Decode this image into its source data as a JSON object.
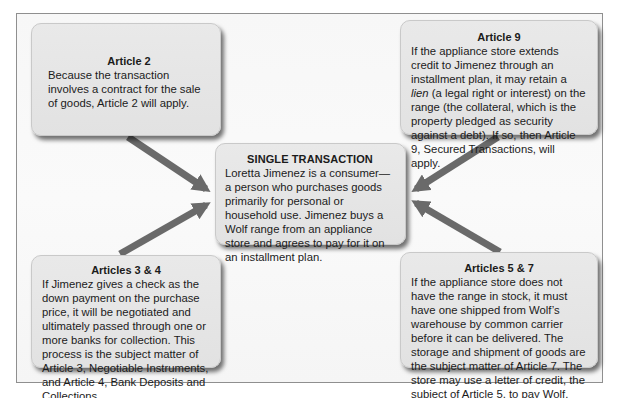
{
  "diagram": {
    "center": {
      "title": "SINGLE TRANSACTION",
      "text": "Loretta Jimenez is a consumer—a person who purchases goods primarily for personal or household use. Jimenez buys a Wolf range from an appliance store and agrees to pay for it on an installment plan."
    },
    "article2": {
      "title": "Article 2",
      "text": "Because the transaction involves a contract for the sale of goods, Article 2 will apply."
    },
    "article9": {
      "title": "Article 9",
      "text_before": "If the appliance store extends credit to Jimenez through an installment plan, it may retain a ",
      "text_italic": "lien",
      "text_after": " (a legal right or interest) on the range (the collateral, which is the property pledged as security against a debt). If so, then Article 9, Secured Transactions, will apply."
    },
    "articles34": {
      "title": "Articles 3 & 4",
      "text": "If Jimenez gives a check as the down payment on the purchase price, it will be negotiated and ultimately passed through one or more banks for collection. This process is the subject matter of Article 3, Negotiable Instruments, and Article 4, Bank Deposits and Collections."
    },
    "articles57": {
      "title": "Articles 5 & 7",
      "text": "If the appliance store does not have the range in stock, it must have one shipped from Wolf’s warehouse by common carrier before it can be delivered. The storage and shipment of goods are the subject matter of Article 7. The store may use a letter of credit, the subject of Article 5, to pay Wolf."
    },
    "arrows": [
      {
        "from": "article2",
        "to": "center"
      },
      {
        "from": "articles34",
        "to": "center"
      },
      {
        "from": "article9",
        "to": "center"
      },
      {
        "from": "articles57",
        "to": "center"
      }
    ],
    "colors": {
      "arrow": "#6a6a6a",
      "box_fill": "#e6e6e6",
      "frame_border": "#8f8f8f",
      "background": "#f8f8f8"
    }
  }
}
